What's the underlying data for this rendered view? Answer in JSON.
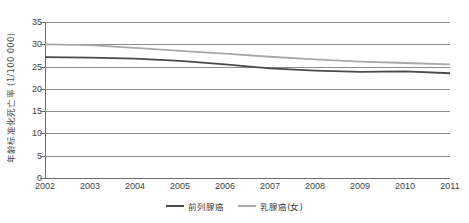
{
  "chart_data": {
    "type": "line",
    "title": "",
    "xlabel": "",
    "ylabel": "年龄标准化死亡率 (1/100 000)",
    "categories": [
      "2002",
      "2003",
      "2004",
      "2005",
      "2006",
      "2007",
      "2008",
      "2009",
      "2010",
      "2011"
    ],
    "ylim": [
      0,
      35
    ],
    "ytick_step": 5,
    "yticks": [
      "35",
      "30",
      "25",
      "20",
      "15",
      "10",
      "5",
      "0"
    ],
    "grid": true,
    "legend_position": "bottom-center",
    "series": [
      {
        "name": "前列腺癌",
        "color": "#4a4a4a",
        "values": [
          27.1,
          27.0,
          26.8,
          26.3,
          25.5,
          24.6,
          24.1,
          23.8,
          23.9,
          23.5
        ]
      },
      {
        "name": "乳腺癌(女)",
        "color": "#a8a8a8",
        "values": [
          30.0,
          29.8,
          29.2,
          28.5,
          27.9,
          27.2,
          26.6,
          26.1,
          25.8,
          25.5
        ]
      }
    ]
  },
  "axes": {
    "y_title": "年龄标准化死亡率 (1/100 000)"
  },
  "legend": {
    "items": [
      {
        "label": "前列腺癌",
        "color": "#4a4a4a"
      },
      {
        "label": "乳腺癌(女)",
        "color": "#a8a8a8"
      }
    ]
  }
}
